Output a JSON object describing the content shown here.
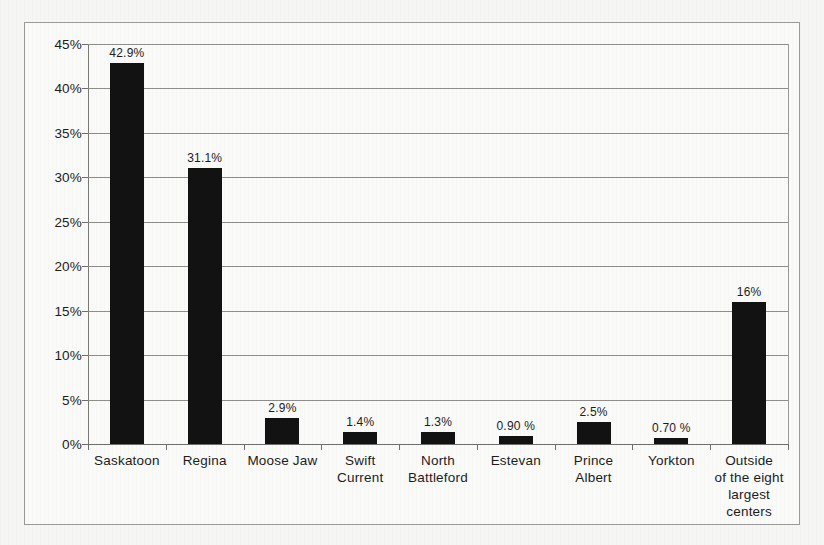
{
  "chart_data": {
    "type": "bar",
    "title": "",
    "xlabel": "",
    "ylabel": "",
    "ylim": [
      0,
      45
    ],
    "grid": true,
    "legend": "none",
    "orientation": "vertical",
    "bar_color": "#121212",
    "gridline_color": "#8d8d8b",
    "background_color": "#fafaf8",
    "categories": [
      "Saskatoon",
      "Regina",
      "Moose Jaw",
      "Swift Current",
      "North Battleford",
      "Estevan",
      "Prince Albert",
      "Yorkton",
      "Outside of the eight largest centers"
    ],
    "category_label_lines": [
      [
        "Saskatoon"
      ],
      [
        "Regina"
      ],
      [
        "Moose Jaw"
      ],
      [
        "Swift",
        "Current"
      ],
      [
        "North",
        "Battleford"
      ],
      [
        "Estevan"
      ],
      [
        "Prince",
        "Albert"
      ],
      [
        "Yorkton"
      ],
      [
        "Outside",
        "of the eight",
        "largest centers"
      ]
    ],
    "values": [
      42.9,
      31.1,
      2.9,
      1.4,
      1.3,
      0.9,
      2.5,
      0.7,
      16
    ],
    "data_labels": [
      "42.9%",
      "31.1%",
      "2.9%",
      "1.4%",
      "1.3%",
      "0.90 %",
      "2.5%",
      "0.70 %",
      "16%"
    ],
    "yticks": [
      0,
      5,
      10,
      15,
      20,
      25,
      30,
      35,
      40,
      45
    ],
    "ytick_labels": [
      "0%",
      "5%",
      "10%",
      "15%",
      "20%",
      "25%",
      "30%",
      "35%",
      "40%",
      "45%"
    ]
  }
}
